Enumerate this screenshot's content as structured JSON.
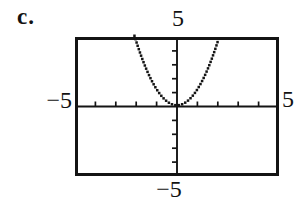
{
  "label": "c.",
  "colors": {
    "ink": "#141414",
    "background": "#ffffff"
  },
  "chart_data": {
    "type": "line",
    "title": "",
    "xlabel": "",
    "ylabel": "",
    "style": "calculator-dot-plot",
    "grid": false,
    "window": {
      "xmin": -5,
      "xmax": 5,
      "ymin": -5,
      "ymax": 5,
      "xscl": 1,
      "yscl": 1
    },
    "axis_labels": {
      "top": "5",
      "left": "−5",
      "right": "5",
      "bottom": "−5"
    },
    "curve": {
      "equation": "y = x^2 (approx. y = 1.15x^2 as drawn)",
      "coefficient": 1.15,
      "x_range": [
        -2.085,
        2.085
      ]
    },
    "points": {
      "x": [
        -2,
        -1.5,
        -1,
        -0.5,
        0,
        0.5,
        1,
        1.5,
        2
      ],
      "y": [
        4.6,
        2.59,
        1.15,
        0.29,
        0,
        0.29,
        1.15,
        2.59,
        4.6
      ]
    }
  }
}
